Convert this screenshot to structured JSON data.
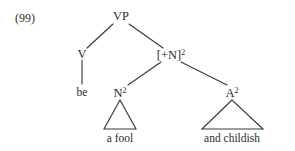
{
  "figure": {
    "example_number": "(99)",
    "kind": "syntax-tree",
    "ink_color": "#3a3a3a",
    "text_color": "#2b2b2b",
    "background_color": "#ffffff"
  },
  "nodes": {
    "root": {
      "label": "VP",
      "superscript": ""
    },
    "verb": {
      "label": "V",
      "superscript": ""
    },
    "predicate": {
      "label": "[+N]",
      "superscript": "2"
    },
    "noun_phrase": {
      "label": "N",
      "superscript": "2"
    },
    "adj_phrase": {
      "label": "A",
      "superscript": "2"
    }
  },
  "leaves": {
    "verb_word": "be",
    "noun_phrase_words": "a fool",
    "adj_phrase_words": "and childish"
  }
}
